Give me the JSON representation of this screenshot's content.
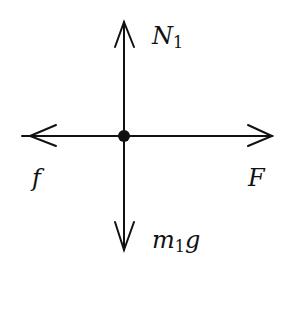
{
  "diagram": {
    "type": "free-body-diagram",
    "forces": {
      "up": {
        "symbol": "N",
        "subscript": "1"
      },
      "down": {
        "symbol": "m",
        "subscript": "1",
        "suffix": "g"
      },
      "left": {
        "symbol": "f"
      },
      "right": {
        "symbol": "F"
      }
    },
    "colors": {
      "ink": "#111111",
      "background": "#ffffff"
    }
  }
}
